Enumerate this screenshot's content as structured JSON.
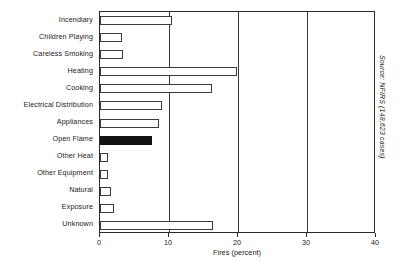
{
  "chart_data": {
    "type": "bar",
    "orientation": "horizontal",
    "title": "",
    "xlabel": "Fires (percent)",
    "ylabel": "",
    "xlim": [
      0,
      40
    ],
    "xticks": [
      0,
      10,
      20,
      30,
      40
    ],
    "xtick_labels": [
      "0",
      "10",
      "20",
      "30",
      "40"
    ],
    "grid": true,
    "legend": false,
    "annotations": [
      "Source: NFIRS (148,623 cases)"
    ],
    "categories": [
      "Incendiary",
      "Children Playing",
      "Careless Smoking",
      "Heating",
      "Cooking",
      "Electrical Distribution",
      "Appliances",
      "Open Flame",
      "Other Heat",
      "Other Equipment",
      "Natural",
      "Exposure",
      "Unknown"
    ],
    "values": [
      10.5,
      3.2,
      3.3,
      19.8,
      16.2,
      9.0,
      8.6,
      7.6,
      1.2,
      1.1,
      1.6,
      2.0,
      16.4
    ],
    "bar_fill": [
      "hollow",
      "hollow",
      "hollow",
      "hollow",
      "hollow",
      "hollow",
      "hollow",
      "solid",
      "hollow",
      "hollow",
      "hollow",
      "hollow",
      "hollow"
    ],
    "colors": {
      "bar_outline": "#3a3a3a",
      "bar_hollow_fill": "#ffffff",
      "bar_solid_fill": "#121212",
      "axis": "#2b2b2b",
      "gridline": "#3a3a3a",
      "text": "#1a1a1a",
      "background": "#ffffff"
    }
  },
  "source": {
    "note": "Source: NFIRS (148,623 cases)"
  },
  "axis": {
    "x_title": "Fires (percent)"
  }
}
